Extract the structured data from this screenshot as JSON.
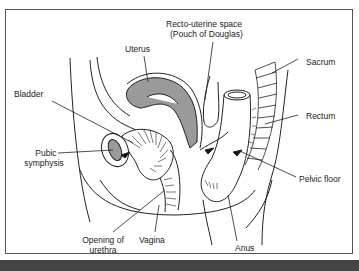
{
  "diagram": {
    "labels": {
      "recto_uterine_1": "Recto-uterine space",
      "recto_uterine_2": "(Pouch of Douglas)",
      "uterus": "Uterus",
      "sacrum": "Sacrum",
      "bladder": "Bladder",
      "rectum": "Rectum",
      "pubic_1": "Pubic",
      "pubic_2": "symphysis",
      "pelvic_floor": "Pelvic floor",
      "urethra_1": "Opening of",
      "urethra_2": "urethra",
      "vagina": "Vagina",
      "anus": "Anus"
    },
    "colors": {
      "line": "#222222",
      "fill_grey": "#9a9a9a",
      "frame": "#555555",
      "bar": "#444444"
    }
  }
}
